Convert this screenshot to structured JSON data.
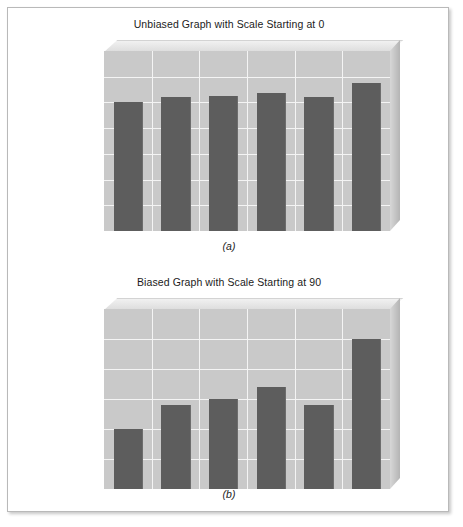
{
  "figures": [
    {
      "key": "a",
      "caption": "(a)",
      "chart_data": {
        "type": "bar",
        "title": "Unbiased Graph with Scale Starting at 0",
        "categories": [
          "2003",
          "2004",
          "2005",
          "2006",
          "2007",
          "2008"
        ],
        "values": [
          100,
          104,
          105,
          107,
          104,
          115
        ],
        "xlabel": "",
        "ylabel": "",
        "ylim": [
          0,
          140
        ],
        "ytick_step": 20,
        "yticks": [
          0,
          20,
          40,
          60,
          80,
          100,
          120,
          140
        ],
        "ytick_labels": [
          "0",
          "20",
          "40",
          "60",
          "80",
          "100",
          "120",
          "140"
        ],
        "grid": true,
        "legend": "none",
        "bar_color": "#5d5d5d",
        "plot_bg_color": "#c9c9c9",
        "gridline_color": "#f4f4f4"
      }
    },
    {
      "key": "b",
      "caption": "(b)",
      "chart_data": {
        "type": "bar",
        "title": "Biased Graph with Scale Starting at 90",
        "categories": [
          "2003",
          "2004",
          "2005",
          "2006",
          "2007",
          "2008"
        ],
        "values": [
          100,
          104,
          105,
          107,
          104,
          115
        ],
        "xlabel": "",
        "ylabel": "",
        "ylim": [
          90,
          120
        ],
        "ytick_step": 5,
        "yticks": [
          90,
          95,
          100,
          105,
          110,
          115,
          120
        ],
        "ytick_labels": [
          "90",
          "95",
          "100",
          "105",
          "110",
          "115",
          "120"
        ],
        "grid": true,
        "legend": "none",
        "bar_color": "#5d5d5d",
        "plot_bg_color": "#c9c9c9",
        "gridline_color": "#f4f4f4"
      }
    }
  ]
}
